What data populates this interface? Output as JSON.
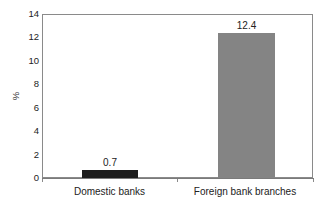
{
  "chart_data": {
    "type": "bar",
    "title": "",
    "subtitle": "",
    "xlabel": "",
    "ylabel": "%",
    "categories": [
      "Domestic banks",
      "Foreign bank branches"
    ],
    "values": [
      0.7,
      12.4
    ],
    "value_labels": [
      "0.7",
      "12.4"
    ],
    "bar_colors": [
      "#1c1c1c",
      "#848484"
    ],
    "ylim": [
      0,
      14
    ],
    "y_ticks": [
      0,
      2,
      4,
      6,
      8,
      10,
      12,
      14
    ],
    "y_tick_labels": [
      "0",
      "2",
      "4",
      "6",
      "8",
      "10",
      "12",
      "14"
    ],
    "grid": false,
    "legend": null,
    "frame": true,
    "annotations": []
  },
  "axes": {
    "y_title": "%"
  }
}
